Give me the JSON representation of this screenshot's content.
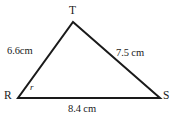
{
  "figure": {
    "type": "triangle-diagram",
    "shape_name": "triangle RST",
    "stroke_color": "#1a1a1a",
    "background_color": "#ffffff",
    "vertices": [
      {
        "id": "T",
        "label": "T",
        "x": 73,
        "y": 22
      },
      {
        "id": "R",
        "label": "R",
        "x": 18,
        "y": 98
      },
      {
        "id": "S",
        "label": "S",
        "x": 160,
        "y": 98
      }
    ],
    "sides": [
      {
        "id": "RT",
        "label": "6.6cm",
        "value": 6.6,
        "unit": "cm",
        "from": "R",
        "to": "T"
      },
      {
        "id": "TS",
        "label": "7.5 cm",
        "value": 7.5,
        "unit": "cm",
        "from": "T",
        "to": "S"
      },
      {
        "id": "RS",
        "label": "8.4 cm",
        "value": 8.4,
        "unit": "cm",
        "from": "R",
        "to": "S"
      }
    ],
    "angles": [
      {
        "id": "R",
        "label": "r",
        "at_vertex": "R"
      }
    ]
  }
}
